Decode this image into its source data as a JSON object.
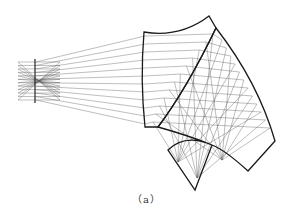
{
  "figure": {
    "caption": "（a）",
    "type": "freeform prism optical ray-trace",
    "colors": {
      "edge": "#1a1a1a",
      "ray": "#555555",
      "background": "#ffffff"
    }
  },
  "stop": {
    "x": 35,
    "y1": 59,
    "y2": 103
  },
  "source": {
    "x": 18,
    "y_top": 62,
    "y_bottom": 100,
    "ray_count": 12
  },
  "prism": {
    "element1": "M144,32 Q180,38 209,16 L216,28 Q186,90 158,127 L145,127 Q140,80 144,32 Z",
    "element2": "M216,28 Q258,82 275,141 L248,171 Q225,150 212,145 L195,190 L168,150 Q185,133 212,145 Q190,136 158,127 Q186,90 216,28 Z"
  }
}
